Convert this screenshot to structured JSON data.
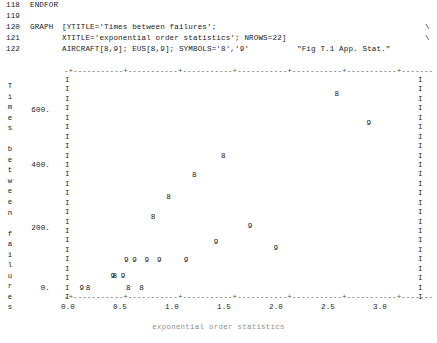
{
  "listing": {
    "lines": [
      {
        "num": "118",
        "keyword": "ENDFOR",
        "args": "",
        "cont": "",
        "note": ""
      },
      {
        "num": "119",
        "keyword": "",
        "args": "",
        "cont": "",
        "note": ""
      },
      {
        "num": "120",
        "keyword": "GRAPH",
        "args": "[YTITLE='Times between failures';",
        "cont": "\\",
        "note": ""
      },
      {
        "num": "121",
        "keyword": "",
        "args": "XTITLE='exponential order statistics'; NROWS=22]",
        "cont": "\\",
        "note": ""
      },
      {
        "num": "122",
        "keyword": "",
        "args": "AIRCRAFT[8,9]; EUS[8,9]; SYMBOLS='8','9'",
        "cont": "",
        "note": "\"Fig T.1 App. Stat.\""
      }
    ]
  },
  "chart_data": {
    "type": "scatter",
    "title": "",
    "xlabel": "exponential order statistics",
    "ylabel": "Times between failures",
    "xlim": [
      0.0,
      3.4
    ],
    "ylim": [
      0.0,
      700.0
    ],
    "grid": false,
    "legend": "none",
    "xticks": [
      "0.0",
      "0.5",
      "1.0",
      "1.5",
      "2.0",
      "2.5",
      "3.0"
    ],
    "xtick_values": [
      0.0,
      0.5,
      1.0,
      1.5,
      2.0,
      2.5,
      3.0
    ],
    "yticks": [
      "600.",
      "400.",
      "200.",
      "0."
    ],
    "ytick_values": [
      600,
      400,
      200,
      0
    ],
    "border_char": "I",
    "axis_rule_top": "-+-----------+-----------+-----------+-----------+-----------+-----------+-------",
    "axis_rule_bottom": "-+-----------+-----------+-----------+-----------+-----------+-----------+-------",
    "series": [
      {
        "name": "AIRCRAFT 8",
        "symbol": "8",
        "points": [
          {
            "x": 2.62,
            "y": 630
          },
          {
            "x": 1.52,
            "y": 430
          },
          {
            "x": 1.24,
            "y": 370
          },
          {
            "x": 0.99,
            "y": 300
          },
          {
            "x": 0.84,
            "y": 235
          },
          {
            "x": 0.47,
            "y": 45
          },
          {
            "x": 0.6,
            "y": 5
          },
          {
            "x": 0.73,
            "y": 5
          },
          {
            "x": 0.21,
            "y": 5
          }
        ]
      },
      {
        "name": "AIRCRAFT 9",
        "symbol": "9",
        "points": [
          {
            "x": 2.93,
            "y": 535
          },
          {
            "x": 1.78,
            "y": 205
          },
          {
            "x": 1.45,
            "y": 155
          },
          {
            "x": 2.03,
            "y": 135
          },
          {
            "x": 1.16,
            "y": 95
          },
          {
            "x": 0.66,
            "y": 95
          },
          {
            "x": 0.9,
            "y": 95
          },
          {
            "x": 0.78,
            "y": 95
          },
          {
            "x": 0.58,
            "y": 95
          },
          {
            "x": 0.45,
            "y": 45
          },
          {
            "x": 0.55,
            "y": 45
          },
          {
            "x": 0.15,
            "y": 5
          }
        ]
      }
    ]
  }
}
